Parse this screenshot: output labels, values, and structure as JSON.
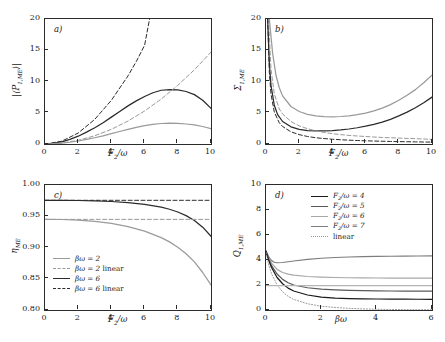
{
  "figure": {
    "background": "#ffffff",
    "axis_color": "#2b2b2b",
    "panels": [
      "a)",
      "b)",
      "c)",
      "d)"
    ]
  },
  "panel_a": {
    "label": "a)",
    "ylabel_html": "|&#10216;P<sub>1,ME</sub>&#10217;|",
    "xlabel_html": "F<sub>2</sub>/&#969;",
    "yticks": [
      "0",
      "5",
      "10",
      "15",
      "20"
    ],
    "xticks": [
      "0",
      "2",
      "4",
      "6",
      "8",
      "10"
    ]
  },
  "panel_b": {
    "label": "b)",
    "ylabel_html": "&#931;<sub>1,ME</sub>",
    "xlabel_html": "F<sub>2</sub>/&#969;",
    "yticks": [
      "0",
      "5",
      "10",
      "15",
      "20"
    ],
    "xticks": [
      "0",
      "2",
      "4",
      "6",
      "8",
      "10"
    ]
  },
  "panel_c": {
    "label": "c)",
    "ylabel_html": "&#951;<sub>ME</sub>",
    "xlabel_html": "F<sub>2</sub>/&#969;",
    "yticks": [
      "0.80",
      "0.85",
      "0.90",
      "0.95",
      "1.00"
    ],
    "xticks": [
      "0",
      "2",
      "4",
      "6",
      "8",
      "10"
    ],
    "legend": [
      {
        "label_html": "&#946;&#969; = 2",
        "style": "solid",
        "color": "#9a9a9a"
      },
      {
        "label_html": "&#946;&#969; = 2  <span class=\"up\">linear</span>",
        "style": "dashed",
        "color": "#9a9a9a"
      },
      {
        "label_html": "&#946;&#969; = 6",
        "style": "solid",
        "color": "#2b2b2b"
      },
      {
        "label_html": "&#946;&#969; = 6  <span class=\"up\">linear</span>",
        "style": "dashed",
        "color": "#2b2b2b"
      }
    ]
  },
  "panel_d": {
    "label": "d)",
    "ylabel_html": "Q<sub>1,ME</sub>",
    "xlabel_html": "&#946;&#969;",
    "yticks": [
      "0",
      "2",
      "4",
      "6",
      "8",
      "10"
    ],
    "xticks": [
      "0",
      "2",
      "4",
      "6"
    ],
    "legend": [
      {
        "label_html": "F<sub>2</sub>/&#969; = 4",
        "style": "solid",
        "color": "#1a1a1a"
      },
      {
        "label_html": "F<sub>2</sub>/&#969; = 5",
        "style": "solid",
        "color": "#595959"
      },
      {
        "label_html": "F<sub>2</sub>/&#969; = 6",
        "style": "solid",
        "color": "#a8a8a8"
      },
      {
        "label_html": "F<sub>2</sub>/&#969; = 7",
        "style": "solid",
        "color": "#7d7d7d"
      },
      {
        "label_html": "<span class=\"up\">linear</span>",
        "style": "dotted",
        "color": "#9a9a9a"
      }
    ]
  },
  "chart_data": [
    {
      "type": "line",
      "panel": "a",
      "title": "a)",
      "xlabel": "F2/omega",
      "ylabel": "|<P_1,ME>|",
      "xlim": [
        0,
        10
      ],
      "ylim": [
        0,
        20
      ],
      "grid": false,
      "legend_position": "none",
      "series": [
        {
          "name": "beta*omega = 6",
          "style": "solid",
          "color": "#2b2b2b",
          "x": [
            0,
            0.5,
            1,
            1.5,
            2,
            2.5,
            3,
            3.5,
            4,
            4.5,
            5,
            5.5,
            6,
            6.5,
            7,
            7.5,
            8,
            8.5,
            9,
            9.5,
            10
          ],
          "y": [
            0,
            0.1,
            0.35,
            0.75,
            1.25,
            1.9,
            2.6,
            3.4,
            4.3,
            5.2,
            6.1,
            6.9,
            7.6,
            8.2,
            8.6,
            8.7,
            8.65,
            8.4,
            7.9,
            7.0,
            5.7
          ]
        },
        {
          "name": "beta*omega = 2",
          "style": "solid",
          "color": "#9a9a9a",
          "x": [
            0,
            0.5,
            1,
            1.5,
            2,
            2.5,
            3,
            3.5,
            4,
            4.5,
            5,
            5.5,
            6,
            6.5,
            7,
            7.5,
            8,
            8.5,
            9,
            9.5,
            10
          ],
          "y": [
            0,
            0.04,
            0.13,
            0.28,
            0.48,
            0.73,
            1.0,
            1.3,
            1.65,
            2.0,
            2.35,
            2.65,
            2.95,
            3.15,
            3.28,
            3.33,
            3.3,
            3.2,
            3.05,
            2.8,
            2.45
          ]
        },
        {
          "name": "beta*omega = 6 linear",
          "style": "dashed",
          "color": "#2b2b2b",
          "x": [
            0,
            1,
            2,
            3,
            4,
            5,
            5.5,
            6,
            6.3
          ],
          "y": [
            0,
            0.44,
            1.75,
            3.95,
            7.0,
            10.9,
            13.2,
            15.8,
            20.0
          ]
        },
        {
          "name": "beta*omega = 2 linear",
          "style": "dashed",
          "color": "#9a9a9a",
          "x": [
            0,
            1,
            2,
            3,
            4,
            5,
            6,
            7,
            8,
            9,
            10
          ],
          "y": [
            0,
            0.15,
            0.59,
            1.32,
            2.35,
            3.67,
            5.28,
            7.19,
            9.39,
            11.88,
            14.7
          ]
        }
      ]
    },
    {
      "type": "line",
      "panel": "b",
      "title": "b)",
      "xlabel": "F2/omega",
      "ylabel": "Sigma_1,ME",
      "xlim": [
        0,
        10
      ],
      "ylim": [
        0,
        20
      ],
      "grid": false,
      "legend_position": "none",
      "series": [
        {
          "name": "curve-1-upper-solid",
          "style": "solid",
          "color": "#9a9a9a",
          "x": [
            0.2,
            0.4,
            0.6,
            0.8,
            1,
            1.5,
            2,
            2.5,
            3,
            3.5,
            4,
            4.5,
            5,
            5.5,
            6,
            6.5,
            7,
            7.5,
            8,
            8.5,
            9,
            9.5,
            10
          ],
          "y": [
            20,
            14.5,
            11.0,
            9.0,
            7.7,
            6.0,
            5.2,
            4.75,
            4.5,
            4.38,
            4.35,
            4.4,
            4.5,
            4.7,
            4.95,
            5.3,
            5.75,
            6.3,
            7.0,
            7.8,
            8.7,
            9.8,
            11.0
          ]
        },
        {
          "name": "curve-2-solid",
          "style": "solid",
          "color": "#2b2b2b",
          "x": [
            0.1,
            0.2,
            0.3,
            0.5,
            0.7,
            1,
            1.5,
            2,
            2.5,
            3,
            3.5,
            4,
            4.5,
            5,
            5.5,
            6,
            6.5,
            7,
            7.5,
            8,
            8.5,
            9,
            9.5,
            10
          ],
          "y": [
            20,
            13.0,
            9.4,
            6.2,
            4.7,
            3.6,
            2.75,
            2.35,
            2.15,
            2.1,
            2.1,
            2.15,
            2.25,
            2.4,
            2.6,
            2.85,
            3.15,
            3.5,
            3.95,
            4.5,
            5.1,
            5.8,
            6.6,
            7.5
          ]
        },
        {
          "name": "curve-3-dashed",
          "style": "dashed",
          "color": "#9a9a9a",
          "x": [
            0.15,
            0.3,
            0.5,
            0.8,
            1,
            1.5,
            2,
            2.5,
            3,
            3.5,
            4,
            4.5,
            5,
            5.5,
            6,
            6.5,
            7,
            7.5,
            8,
            8.5,
            9,
            9.5,
            10
          ],
          "y": [
            20,
            12.0,
            8.0,
            5.6,
            4.8,
            3.6,
            2.9,
            2.45,
            2.1,
            1.85,
            1.65,
            1.5,
            1.38,
            1.28,
            1.2,
            1.12,
            1.05,
            1.0,
            0.95,
            0.9,
            0.85,
            0.8,
            0.75
          ]
        },
        {
          "name": "curve-4-dashed",
          "style": "dashed",
          "color": "#2b2b2b",
          "x": [
            0.1,
            0.2,
            0.3,
            0.5,
            0.8,
            1,
            1.5,
            2,
            2.5,
            3,
            3.5,
            4,
            4.5,
            5,
            5.5,
            6,
            6.5,
            7,
            7.5,
            8,
            8.5,
            9,
            9.5,
            10
          ],
          "y": [
            20,
            11.5,
            8.0,
            5.1,
            3.4,
            2.8,
            1.95,
            1.5,
            1.2,
            1.0,
            0.87,
            0.76,
            0.68,
            0.61,
            0.56,
            0.51,
            0.47,
            0.44,
            0.41,
            0.38,
            0.36,
            0.34,
            0.32,
            0.3
          ]
        }
      ]
    },
    {
      "type": "line",
      "panel": "c",
      "title": "c)",
      "xlabel": "F2/omega",
      "ylabel": "eta_ME",
      "xlim": [
        0,
        10
      ],
      "ylim": [
        0.8,
        1.0
      ],
      "grid": false,
      "legend_position": "lower-left",
      "series": [
        {
          "name": "beta*omega = 6",
          "style": "solid",
          "color": "#2b2b2b",
          "x": [
            0,
            1,
            2,
            3,
            4,
            5,
            6,
            7,
            7.5,
            8,
            8.5,
            9,
            9.5,
            10
          ],
          "y": [
            0.9755,
            0.9755,
            0.9752,
            0.9746,
            0.9736,
            0.9718,
            0.969,
            0.9645,
            0.9612,
            0.9568,
            0.951,
            0.9432,
            0.9325,
            0.918
          ]
        },
        {
          "name": "beta*omega = 6 linear",
          "style": "dashed",
          "color": "#2b2b2b",
          "x": [
            0,
            10
          ],
          "y": [
            0.9755,
            0.9755
          ]
        },
        {
          "name": "beta*omega = 2",
          "style": "solid",
          "color": "#9a9a9a",
          "x": [
            0,
            1,
            2,
            3,
            4,
            5,
            6,
            7,
            7.5,
            8,
            8.5,
            9,
            9.5,
            10
          ],
          "y": [
            0.945,
            0.9448,
            0.9438,
            0.9418,
            0.9385,
            0.9335,
            0.9262,
            0.9158,
            0.909,
            0.9005,
            0.89,
            0.877,
            0.86,
            0.84
          ]
        },
        {
          "name": "beta*omega = 2 linear",
          "style": "dashed",
          "color": "#9a9a9a",
          "x": [
            0,
            10
          ],
          "y": [
            0.945,
            0.945
          ]
        }
      ]
    },
    {
      "type": "line",
      "panel": "d",
      "title": "d)",
      "xlabel": "beta*omega",
      "ylabel": "Q_1,ME",
      "xlim": [
        0,
        6
      ],
      "ylim": [
        0,
        10
      ],
      "grid": false,
      "legend_position": "upper-right",
      "series": [
        {
          "name": "F2/omega = 7",
          "style": "solid",
          "color": "#7d7d7d",
          "x": [
            0,
            0.1,
            0.2,
            0.3,
            0.4,
            0.6,
            0.8,
            1,
            1.5,
            2,
            2.5,
            3,
            3.5,
            4,
            4.5,
            5,
            5.5,
            6
          ],
          "y": [
            4.7,
            4.25,
            3.95,
            3.82,
            3.78,
            3.8,
            3.86,
            3.92,
            4.05,
            4.14,
            4.2,
            4.24,
            4.27,
            4.29,
            4.3,
            4.31,
            4.32,
            4.33
          ]
        },
        {
          "name": "F2/omega = 6",
          "style": "solid",
          "color": "#a8a8a8",
          "x": [
            0,
            0.1,
            0.2,
            0.4,
            0.6,
            0.8,
            1,
            1.5,
            2,
            2.5,
            3,
            3.5,
            4,
            4.5,
            5,
            5.5,
            6
          ],
          "y": [
            4.7,
            4.15,
            3.75,
            3.25,
            3.0,
            2.87,
            2.79,
            2.68,
            2.63,
            2.6,
            2.58,
            2.57,
            2.56,
            2.56,
            2.55,
            2.55,
            2.55
          ]
        },
        {
          "name": "F2/omega = 5",
          "style": "solid",
          "color": "#595959",
          "x": [
            0,
            0.1,
            0.2,
            0.4,
            0.6,
            0.8,
            1,
            1.5,
            2,
            2.5,
            3,
            3.5,
            4,
            4.5,
            5,
            5.5,
            6
          ],
          "y": [
            4.7,
            4.05,
            3.55,
            2.88,
            2.45,
            2.18,
            2.0,
            1.78,
            1.67,
            1.61,
            1.57,
            1.55,
            1.53,
            1.52,
            1.51,
            1.51,
            1.5
          ]
        },
        {
          "name": "F2/omega = 4",
          "style": "solid",
          "color": "#1a1a1a",
          "x": [
            0,
            0.1,
            0.2,
            0.4,
            0.6,
            0.8,
            1,
            1.5,
            2,
            2.5,
            3,
            3.5,
            4,
            4.5,
            5,
            5.5,
            6
          ],
          "y": [
            4.7,
            3.95,
            3.4,
            2.6,
            2.1,
            1.75,
            1.52,
            1.2,
            1.03,
            0.95,
            0.91,
            0.89,
            0.88,
            0.87,
            0.87,
            0.86,
            0.86
          ]
        },
        {
          "name": "linear",
          "style": "dotted",
          "color": "#9a9a9a",
          "x": [
            0,
            0.1,
            0.2,
            0.4,
            0.6,
            0.8,
            1,
            1.5,
            2,
            2.5,
            3,
            3.5,
            4,
            4.5,
            5,
            5.5,
            6
          ],
          "y": [
            4.6,
            3.6,
            2.9,
            2.0,
            1.45,
            1.1,
            0.85,
            0.5,
            0.3,
            0.2,
            0.13,
            0.09,
            0.06,
            0.04,
            0.03,
            0.02,
            0.02
          ]
        },
        {
          "name": "flat-grey-2",
          "style": "solid",
          "color": "#b5b5b5",
          "x": [
            0,
            6
          ],
          "y": [
            1.95,
            1.95
          ]
        }
      ]
    }
  ]
}
